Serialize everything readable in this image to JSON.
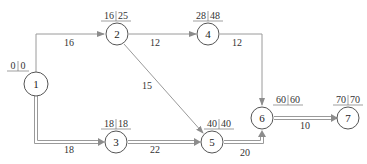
{
  "diagram": {
    "type": "network-schedule",
    "colors": {
      "line": "#8c8c8c",
      "node_stroke": "#555555",
      "text": "#333333",
      "background": "#ffffff"
    },
    "nodes": [
      {
        "id": "1",
        "label": "1",
        "es": "0",
        "ls": "0"
      },
      {
        "id": "2",
        "label": "2",
        "es": "16",
        "ls": "25"
      },
      {
        "id": "3",
        "label": "3",
        "es": "18",
        "ls": "18"
      },
      {
        "id": "4",
        "label": "4",
        "es": "28",
        "ls": "48"
      },
      {
        "id": "5",
        "label": "5",
        "es": "40",
        "ls": "40"
      },
      {
        "id": "6",
        "label": "6",
        "es": "60",
        "ls": "60"
      },
      {
        "id": "7",
        "label": "7",
        "es": "70",
        "ls": "70"
      }
    ],
    "edges": [
      {
        "from": "1",
        "to": "2",
        "duration": "16",
        "critical": false
      },
      {
        "from": "1",
        "to": "3",
        "duration": "18",
        "critical": true
      },
      {
        "from": "2",
        "to": "4",
        "duration": "12",
        "critical": false
      },
      {
        "from": "2",
        "to": "5",
        "duration": "15",
        "critical": false
      },
      {
        "from": "3",
        "to": "5",
        "duration": "22",
        "critical": true
      },
      {
        "from": "4",
        "to": "6",
        "duration": "12",
        "critical": false
      },
      {
        "from": "5",
        "to": "6",
        "duration": "20",
        "critical": true
      },
      {
        "from": "6",
        "to": "7",
        "duration": "10",
        "critical": true
      }
    ]
  }
}
